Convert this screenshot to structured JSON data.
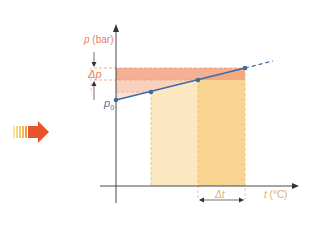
{
  "diagram": {
    "y_axis_label_var": "p",
    "y_axis_label_unit": "(bar)",
    "x_axis_label_var": "t",
    "x_axis_label_unit": "(°C)",
    "delta_p_label": "Δp",
    "delta_t_label": "Δt",
    "p0_label_var": "p",
    "p0_label_sub": "0",
    "points": [
      {
        "name": "p0",
        "x": 116,
        "y": 100
      },
      {
        "name": "point-2",
        "x": 151,
        "y": 92
      },
      {
        "name": "point-3",
        "x": 198,
        "y": 80
      },
      {
        "name": "point-4",
        "x": 245,
        "y": 68
      }
    ],
    "colors": {
      "line": "#3d6aa0",
      "point": "#3d6aa0",
      "pink_dark": "#f2a27f",
      "pink_light": "#f8cdb8",
      "yellow_light": "#fbe7c0",
      "yellow_dark": "#f9d390",
      "axis": "#333333",
      "arrow_red": "#e8542a",
      "arrow_yellow": "#f6c85f"
    },
    "icons": {
      "process_arrow": "right-arrow-icon"
    }
  }
}
